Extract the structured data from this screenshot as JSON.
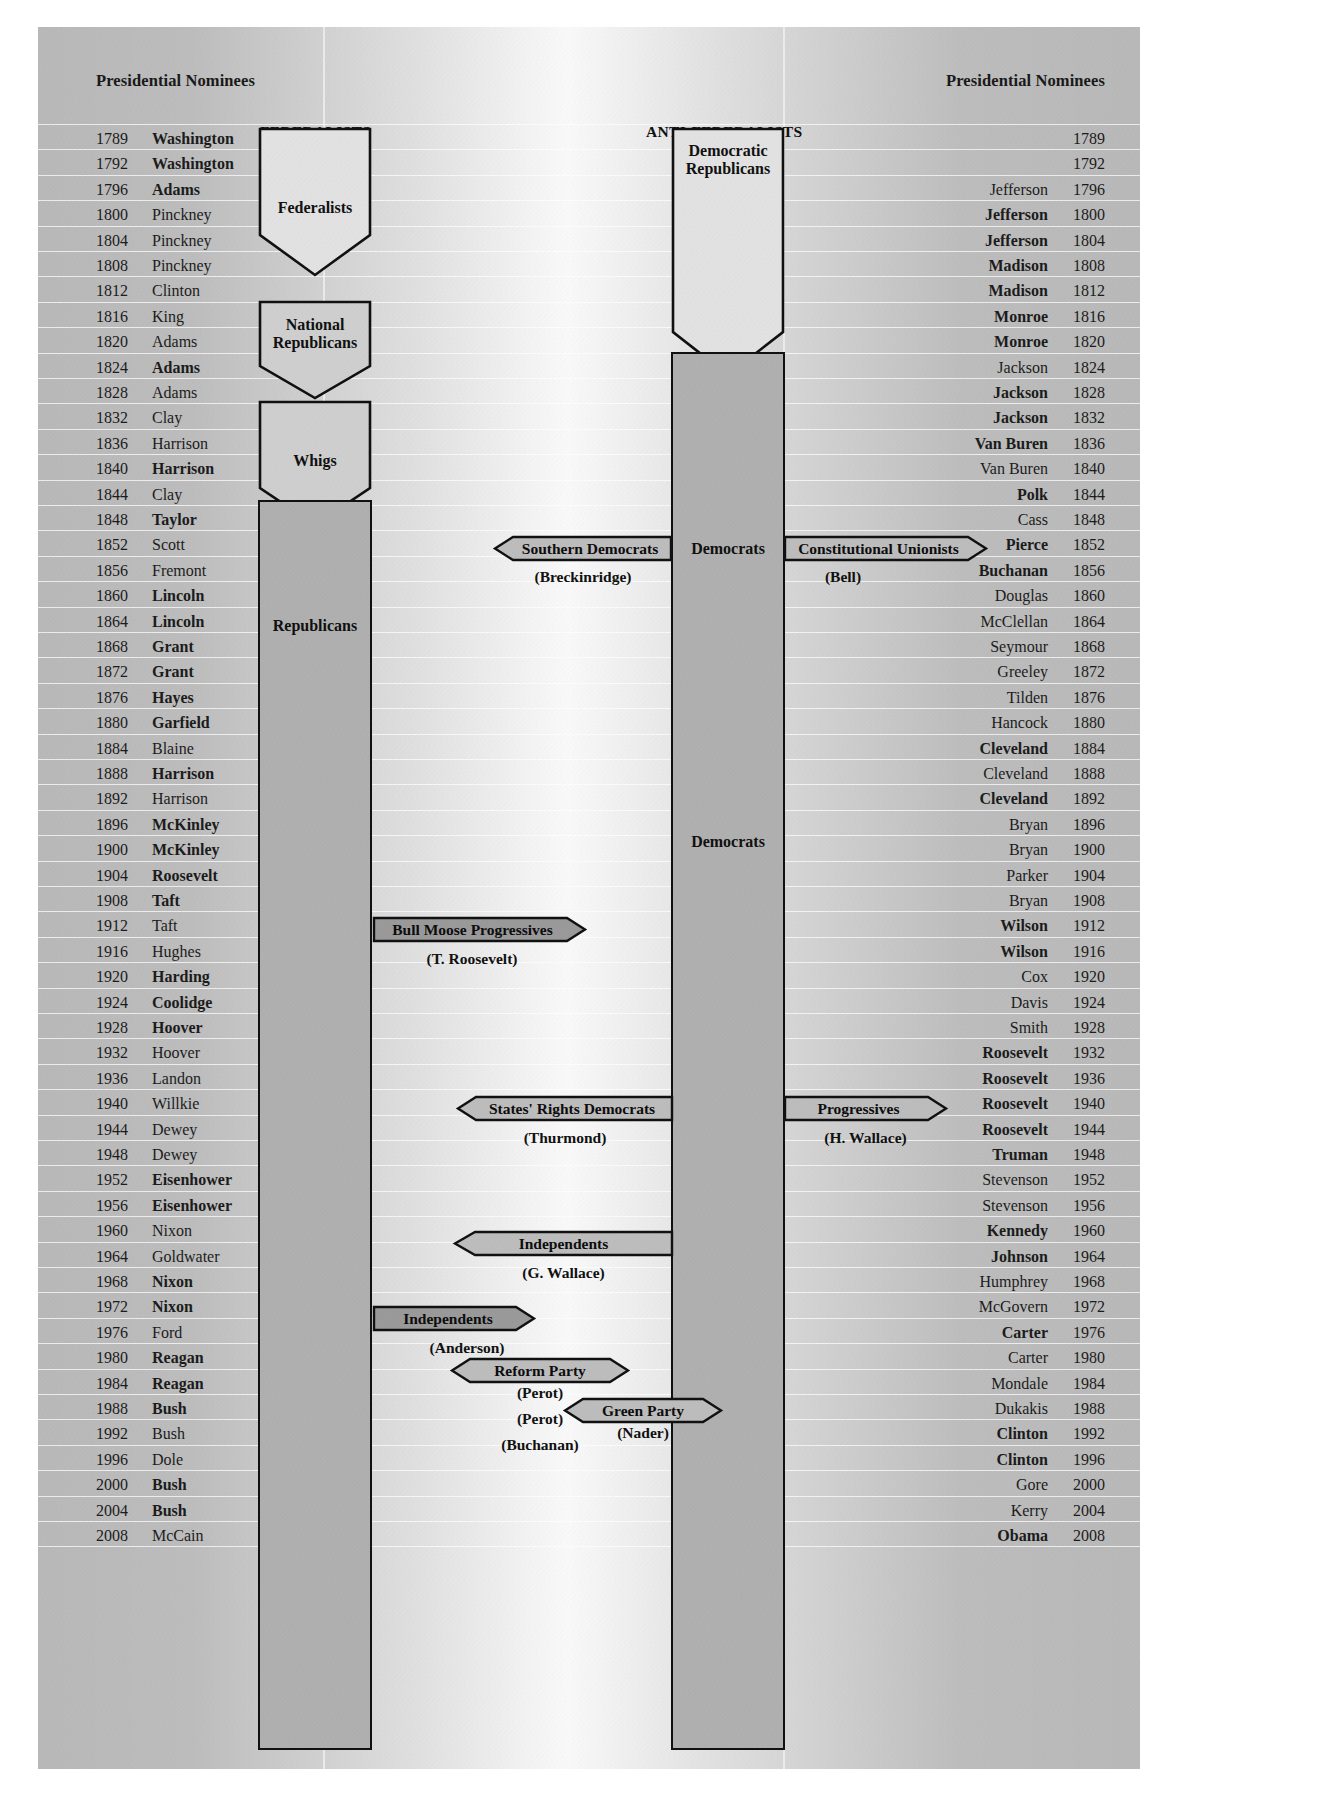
{
  "colors": {
    "paper": "#b9b9b9",
    "ink": "#111111",
    "shape_fill_light": "#e2e2e2",
    "shape_fill_mid": "#c9c9c9",
    "arrow_fill": "#a9a9a9"
  },
  "headers": {
    "left": "Presidential Nominees",
    "right": "Presidential Nominees"
  },
  "top_labels": {
    "federalists": "FEDERALISTS",
    "anti_federalists": "ANTI-FEDERALISTS"
  },
  "center_labels": {
    "democrats_1860": "Democrats",
    "democrats_1908": "Democrats"
  },
  "party_blocks": [
    {
      "id": "federalists",
      "label": "Federalists",
      "label_lines": [
        "Federalists"
      ]
    },
    {
      "id": "national-republicans",
      "label": "National Republicans",
      "label_lines": [
        "National",
        "Republicans"
      ]
    },
    {
      "id": "whigs",
      "label": "Whigs",
      "label_lines": [
        "Whigs"
      ]
    },
    {
      "id": "republicans",
      "label": "Republicans",
      "label_lines": [
        "Republicans"
      ]
    },
    {
      "id": "democratic-republicans",
      "label": "Democratic Republicans",
      "label_lines": [
        "Democratic",
        "Republicans"
      ]
    },
    {
      "id": "democrats",
      "label": "Democrats",
      "label_lines": []
    }
  ],
  "third_parties": [
    {
      "id": "southern-democrats",
      "label": "Southern Democrats",
      "candidate": "(Breckinridge)",
      "year": 1860,
      "direction": "left"
    },
    {
      "id": "constitutional-unionists",
      "label": "Constitutional Unionists",
      "candidate": "(Bell)",
      "year": 1860,
      "direction": "right"
    },
    {
      "id": "bull-moose-progressives",
      "label": "Bull Moose Progressives",
      "candidate": "(T. Roosevelt)",
      "year": 1912,
      "direction": "right"
    },
    {
      "id": "states-rights-democrats",
      "label": "States' Rights Democrats",
      "candidate": "(Thurmond)",
      "year": 1948,
      "direction": "left"
    },
    {
      "id": "progressives",
      "label": "Progressives",
      "candidate": "(H. Wallace)",
      "year": 1948,
      "direction": "right"
    },
    {
      "id": "independents-wallace",
      "label": "Independents",
      "candidate": "(G. Wallace)",
      "year": 1968,
      "direction": "left"
    },
    {
      "id": "independents-anderson",
      "label": "Independents",
      "candidate": "(Anderson)",
      "year": 1980,
      "direction": "right"
    },
    {
      "id": "reform-party",
      "label": "Reform Party",
      "candidate": "(Perot)",
      "year": 1992,
      "direction": "right"
    },
    {
      "id": "reform-party-2",
      "label": "",
      "candidate": "(Perot)",
      "year": 1996,
      "direction": "right"
    },
    {
      "id": "reform-party-3",
      "label": "",
      "candidate": "(Buchanan)",
      "year": 2000,
      "direction": "right"
    },
    {
      "id": "green-party",
      "label": "Green Party",
      "candidate": "(Nader)",
      "year": 1996,
      "direction": "left"
    }
  ],
  "elections": [
    {
      "year": "1789",
      "left": "Washington",
      "left_won": true,
      "right": "",
      "right_won": false
    },
    {
      "year": "1792",
      "left": "Washington",
      "left_won": true,
      "right": "",
      "right_won": false
    },
    {
      "year": "1796",
      "left": "Adams",
      "left_won": true,
      "right": "Jefferson",
      "right_won": false
    },
    {
      "year": "1800",
      "left": "Pinckney",
      "left_won": false,
      "right": "Jefferson",
      "right_won": true
    },
    {
      "year": "1804",
      "left": "Pinckney",
      "left_won": false,
      "right": "Jefferson",
      "right_won": true
    },
    {
      "year": "1808",
      "left": "Pinckney",
      "left_won": false,
      "right": "Madison",
      "right_won": true
    },
    {
      "year": "1812",
      "left": "Clinton",
      "left_won": false,
      "right": "Madison",
      "right_won": true
    },
    {
      "year": "1816",
      "left": "King",
      "left_won": false,
      "right": "Monroe",
      "right_won": true
    },
    {
      "year": "1820",
      "left": "Adams",
      "left_won": false,
      "right": "Monroe",
      "right_won": true
    },
    {
      "year": "1824",
      "left": "Adams",
      "left_won": true,
      "right": "Jackson",
      "right_won": false
    },
    {
      "year": "1828",
      "left": "Adams",
      "left_won": false,
      "right": "Jackson",
      "right_won": true
    },
    {
      "year": "1832",
      "left": "Clay",
      "left_won": false,
      "right": "Jackson",
      "right_won": true
    },
    {
      "year": "1836",
      "left": "Harrison",
      "left_won": false,
      "right": "Van Buren",
      "right_won": true
    },
    {
      "year": "1840",
      "left": "Harrison",
      "left_won": true,
      "right": "Van Buren",
      "right_won": false
    },
    {
      "year": "1844",
      "left": "Clay",
      "left_won": false,
      "right": "Polk",
      "right_won": true
    },
    {
      "year": "1848",
      "left": "Taylor",
      "left_won": true,
      "right": "Cass",
      "right_won": false
    },
    {
      "year": "1852",
      "left": "Scott",
      "left_won": false,
      "right": "Pierce",
      "right_won": true
    },
    {
      "year": "1856",
      "left": "Fremont",
      "left_won": false,
      "right": "Buchanan",
      "right_won": true
    },
    {
      "year": "1860",
      "left": "Lincoln",
      "left_won": true,
      "right": "Douglas",
      "right_won": false
    },
    {
      "year": "1864",
      "left": "Lincoln",
      "left_won": true,
      "right": "McClellan",
      "right_won": false
    },
    {
      "year": "1868",
      "left": "Grant",
      "left_won": true,
      "right": "Seymour",
      "right_won": false
    },
    {
      "year": "1872",
      "left": "Grant",
      "left_won": true,
      "right": "Greeley",
      "right_won": false
    },
    {
      "year": "1876",
      "left": "Hayes",
      "left_won": true,
      "right": "Tilden",
      "right_won": false
    },
    {
      "year": "1880",
      "left": "Garfield",
      "left_won": true,
      "right": "Hancock",
      "right_won": false
    },
    {
      "year": "1884",
      "left": "Blaine",
      "left_won": false,
      "right": "Cleveland",
      "right_won": true
    },
    {
      "year": "1888",
      "left": "Harrison",
      "left_won": true,
      "right": "Cleveland",
      "right_won": false
    },
    {
      "year": "1892",
      "left": "Harrison",
      "left_won": false,
      "right": "Cleveland",
      "right_won": true
    },
    {
      "year": "1896",
      "left": "McKinley",
      "left_won": true,
      "right": "Bryan",
      "right_won": false
    },
    {
      "year": "1900",
      "left": "McKinley",
      "left_won": true,
      "right": "Bryan",
      "right_won": false
    },
    {
      "year": "1904",
      "left": "Roosevelt",
      "left_won": true,
      "right": "Parker",
      "right_won": false
    },
    {
      "year": "1908",
      "left": "Taft",
      "left_won": true,
      "right": "Bryan",
      "right_won": false
    },
    {
      "year": "1912",
      "left": "Taft",
      "left_won": false,
      "right": "Wilson",
      "right_won": true
    },
    {
      "year": "1916",
      "left": "Hughes",
      "left_won": false,
      "right": "Wilson",
      "right_won": true
    },
    {
      "year": "1920",
      "left": "Harding",
      "left_won": true,
      "right": "Cox",
      "right_won": false
    },
    {
      "year": "1924",
      "left": "Coolidge",
      "left_won": true,
      "right": "Davis",
      "right_won": false
    },
    {
      "year": "1928",
      "left": "Hoover",
      "left_won": true,
      "right": "Smith",
      "right_won": false
    },
    {
      "year": "1932",
      "left": "Hoover",
      "left_won": false,
      "right": "Roosevelt",
      "right_won": true
    },
    {
      "year": "1936",
      "left": "Landon",
      "left_won": false,
      "right": "Roosevelt",
      "right_won": true
    },
    {
      "year": "1940",
      "left": "Willkie",
      "left_won": false,
      "right": "Roosevelt",
      "right_won": true
    },
    {
      "year": "1944",
      "left": "Dewey",
      "left_won": false,
      "right": "Roosevelt",
      "right_won": true
    },
    {
      "year": "1948",
      "left": "Dewey",
      "left_won": false,
      "right": "Truman",
      "right_won": true
    },
    {
      "year": "1952",
      "left": "Eisenhower",
      "left_won": true,
      "right": "Stevenson",
      "right_won": false
    },
    {
      "year": "1956",
      "left": "Eisenhower",
      "left_won": true,
      "right": "Stevenson",
      "right_won": false
    },
    {
      "year": "1960",
      "left": "Nixon",
      "left_won": false,
      "right": "Kennedy",
      "right_won": true
    },
    {
      "year": "1964",
      "left": "Goldwater",
      "left_won": false,
      "right": "Johnson",
      "right_won": true
    },
    {
      "year": "1968",
      "left": "Nixon",
      "left_won": true,
      "right": "Humphrey",
      "right_won": false
    },
    {
      "year": "1972",
      "left": "Nixon",
      "left_won": true,
      "right": "McGovern",
      "right_won": false
    },
    {
      "year": "1976",
      "left": "Ford",
      "left_won": false,
      "right": "Carter",
      "right_won": true
    },
    {
      "year": "1980",
      "left": "Reagan",
      "left_won": true,
      "right": "Carter",
      "right_won": false
    },
    {
      "year": "1984",
      "left": "Reagan",
      "left_won": true,
      "right": "Mondale",
      "right_won": false
    },
    {
      "year": "1988",
      "left": "Bush",
      "left_won": true,
      "right": "Dukakis",
      "right_won": false
    },
    {
      "year": "1992",
      "left": "Bush",
      "left_won": false,
      "right": "Clinton",
      "right_won": true
    },
    {
      "year": "1996",
      "left": "Dole",
      "left_won": false,
      "right": "Clinton",
      "right_won": true
    },
    {
      "year": "2000",
      "left": "Bush",
      "left_won": true,
      "right": "Gore",
      "right_won": false
    },
    {
      "year": "2004",
      "left": "Bush",
      "left_won": true,
      "right": "Kerry",
      "right_won": false
    },
    {
      "year": "2008",
      "left": "McCain",
      "left_won": false,
      "right": "Obama",
      "right_won": true
    }
  ]
}
